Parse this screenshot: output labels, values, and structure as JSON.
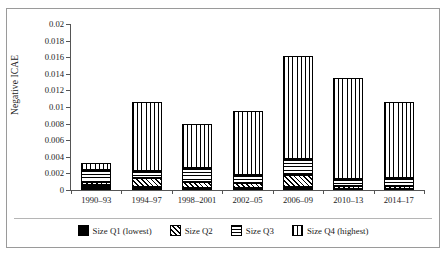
{
  "chart_data": {
    "type": "bar",
    "stacked": true,
    "title": "",
    "xlabel": "",
    "ylabel": "Negative ICAE",
    "ylim": [
      0,
      0.02
    ],
    "ytick_step": 0.002,
    "ytick_labels": [
      "0",
      "0.002",
      "0.004",
      "0.006",
      "0.008",
      "0.01",
      "0.012",
      "0.014",
      "0.016",
      "0.018",
      "0.02"
    ],
    "ytick_values": [
      0,
      0.002,
      0.004,
      0.006,
      0.008,
      0.01,
      0.012,
      0.014,
      0.016,
      0.018,
      0.02
    ],
    "grid": false,
    "legend_position": "bottom",
    "categories": [
      "1990–93",
      "1994–97",
      "1998–2001",
      "2002–05",
      "2006–09",
      "2010–13",
      "2014–17"
    ],
    "series": [
      {
        "name": "Size Q1 (lowest)",
        "pattern": "solid-black",
        "values": [
          0.0006,
          0.0004,
          0.0002,
          0.0002,
          0.0004,
          0.0001,
          0.0001
        ]
      },
      {
        "name": "Size Q2",
        "pattern": "diagonal-hatch",
        "values": [
          0.0004,
          0.0011,
          0.0008,
          0.0007,
          0.0014,
          0.0004,
          0.0004
        ]
      },
      {
        "name": "Size Q3",
        "pattern": "horizontal-lines",
        "values": [
          0.0014,
          0.0008,
          0.0016,
          0.0009,
          0.0019,
          0.0008,
          0.0009
        ]
      },
      {
        "name": "Size Q4 (highest)",
        "pattern": "vertical-lines",
        "values": [
          0.0009,
          0.0083,
          0.0054,
          0.0077,
          0.0124,
          0.0122,
          0.0092
        ]
      }
    ],
    "totals": [
      0.0033,
      0.0106,
      0.008,
      0.0095,
      0.0161,
      0.0135,
      0.0106
    ]
  },
  "legend": {
    "items": [
      {
        "label": "Size Q1 (lowest)"
      },
      {
        "label": "Size Q2"
      },
      {
        "label": "Size Q3"
      },
      {
        "label": "Size Q4 (highest)"
      }
    ]
  }
}
